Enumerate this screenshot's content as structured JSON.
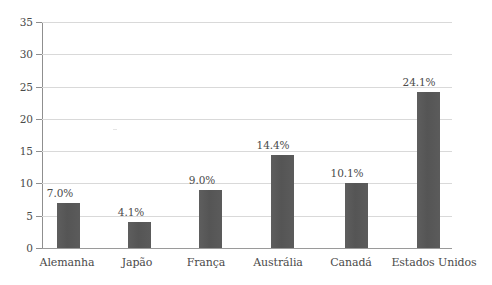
{
  "chart_data": {
    "type": "bar",
    "title": "",
    "subtitle": "",
    "xlabel": "",
    "ylabel": "",
    "categories": [
      "Alemanha",
      "Japão",
      "França",
      "Austrália",
      "Canadá",
      "Estados Unidos"
    ],
    "values": [
      7.0,
      4.1,
      9.0,
      14.4,
      10.1,
      24.1
    ],
    "data_labels": [
      "7.0%",
      "4.1%",
      "9.0%",
      "14.4%",
      "10.1%",
      "24.1%"
    ],
    "ylim": [
      0,
      35
    ],
    "ytick_step": 5,
    "ytick_labels": [
      "0",
      "5",
      "10",
      "15",
      "20",
      "25",
      "30",
      "35"
    ],
    "grid": "horizontal",
    "legend": "none",
    "series": [
      {
        "name": "",
        "values": [
          7.0,
          4.1,
          9.0,
          14.4,
          10.1,
          24.1
        ]
      }
    ],
    "colors": {
      "bar": "#585858",
      "gridline": "#d9d9d9",
      "axis": "#8f8f8f",
      "text": "#4a4a4a",
      "background": "#ffffff"
    }
  }
}
